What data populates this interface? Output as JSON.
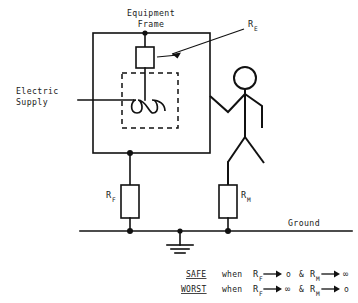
{
  "diagram": {
    "labels": {
      "equipment_frame_line1": "Equipment",
      "equipment_frame_line2": "Frame",
      "electric_supply_line1": "Electric",
      "electric_supply_line2": "Supply",
      "ground": "Ground"
    },
    "components": [
      {
        "id": "r-e",
        "symbol": "R",
        "subscript": "E",
        "name": "earth-resistance-resistor",
        "description": "Resistor between equipment frame top and internal winding"
      },
      {
        "id": "r-f",
        "symbol": "R",
        "subscript": "F",
        "name": "frame-earth-resistance-resistor",
        "description": "Resistor from equipment frame to ground"
      },
      {
        "id": "r-m",
        "symbol": "R",
        "subscript": "M",
        "name": "man-body-resistance-resistor",
        "description": "Resistor from person to ground"
      }
    ],
    "conditions": [
      {
        "key": "SAFE",
        "when": "when",
        "terms": [
          {
            "symbol": "R",
            "subscript": "F",
            "arrow": "→",
            "limit": "o"
          },
          {
            "conj": "&",
            "symbol": "R",
            "subscript": "M",
            "arrow": "→",
            "limit": "∞"
          }
        ]
      },
      {
        "key": "WORST",
        "when": "when",
        "terms": [
          {
            "symbol": "R",
            "subscript": "F",
            "arrow": "→",
            "limit": "∞"
          },
          {
            "conj": "&",
            "symbol": "R",
            "subscript": "M",
            "arrow": "→",
            "limit": "o"
          }
        ]
      }
    ],
    "colors": {
      "ink": "#111111",
      "text": "#1a1a1a",
      "paper": "#ffffff"
    }
  }
}
